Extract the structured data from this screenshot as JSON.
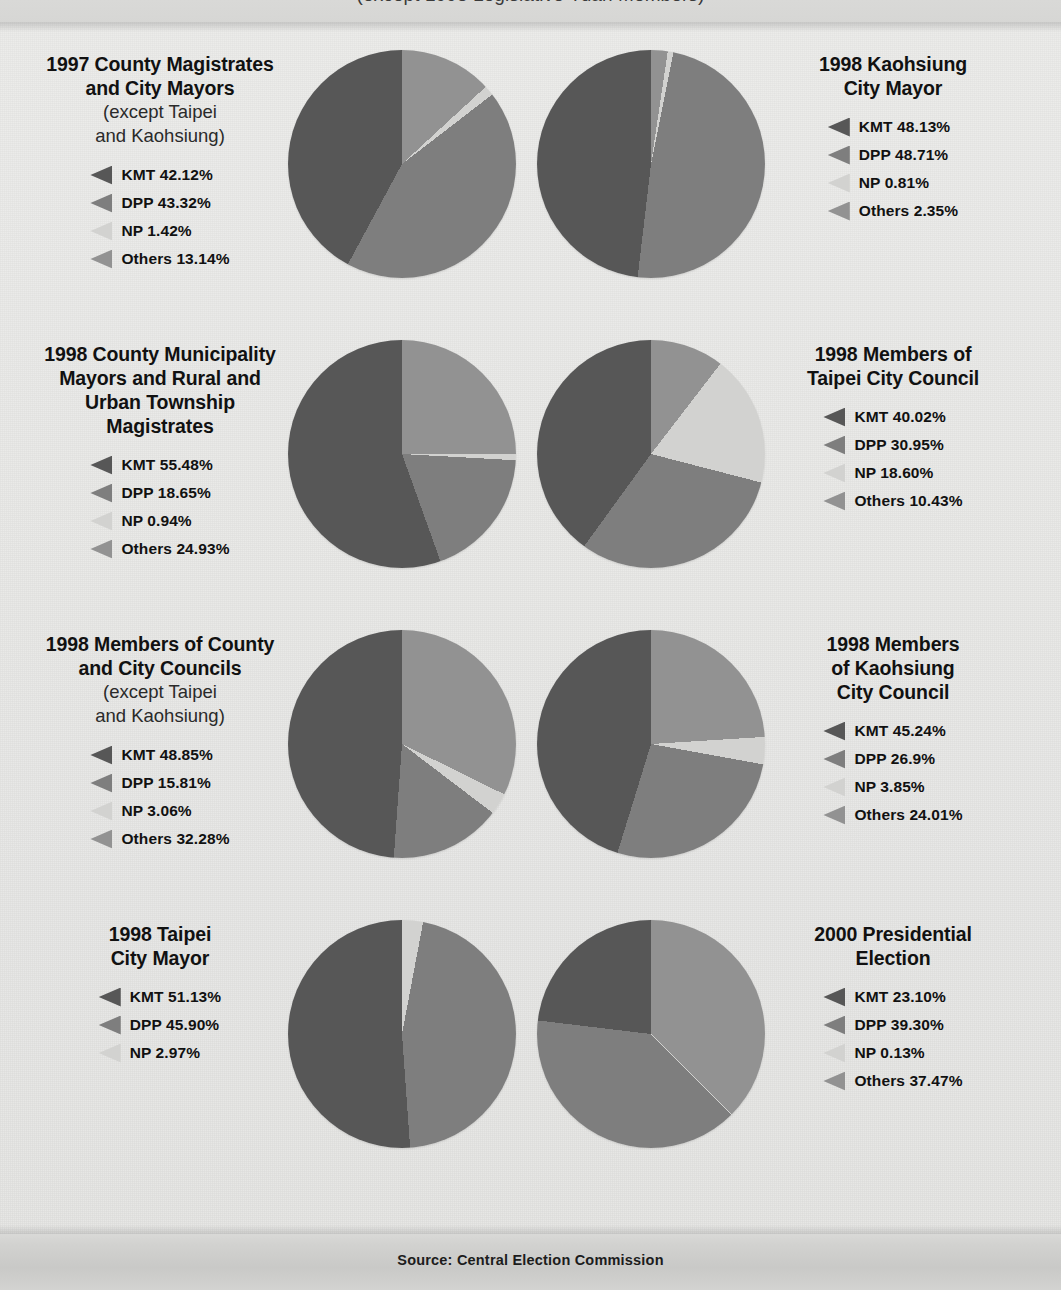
{
  "header": {
    "clipped_note": "(except 1998 Legislative Yuan Members)"
  },
  "footer": {
    "source": "Source: Central Election Commission"
  },
  "colors": {
    "kmt": "#575757",
    "dpp": "#7e7e7e",
    "np": "#d2d2d0",
    "others": "#929292",
    "background": "#e8e8e6",
    "band": "#d4d4d2"
  },
  "chart_data": [
    {
      "type": "pie",
      "title": "1997 County Magistrates",
      "title_line2": "and City Mayors",
      "subtitle": "(except Taipei",
      "subtitle_line2": "and Kaohsiung)",
      "categories": [
        "KMT",
        "DPP",
        "NP",
        "Others"
      ],
      "values": [
        42.12,
        43.32,
        1.42,
        13.14
      ],
      "labels": [
        "KMT 42.12%",
        "DPP 43.32%",
        "NP 1.42%",
        "Others 13.14%"
      ],
      "legend_position": "left",
      "draw_order": [
        "Others",
        "NP",
        "DPP",
        "KMT"
      ],
      "radius": 114
    },
    {
      "type": "pie",
      "title": "1998 Kaohsiung",
      "title_line2": "City Mayor",
      "subtitle": "",
      "subtitle_line2": "",
      "categories": [
        "KMT",
        "DPP",
        "NP",
        "Others"
      ],
      "values": [
        48.13,
        48.71,
        0.81,
        2.35
      ],
      "labels": [
        "KMT 48.13%",
        "DPP 48.71%",
        "NP 0.81%",
        "Others 2.35%"
      ],
      "legend_position": "right",
      "draw_order": [
        "Others",
        "NP",
        "DPP",
        "KMT"
      ],
      "radius": 114
    },
    {
      "type": "pie",
      "title": "1998 County Municipality",
      "title_line2": "Mayors and Rural and",
      "title_line3": "Urban Township",
      "title_line4": "Magistrates",
      "subtitle": "",
      "subtitle_line2": "",
      "categories": [
        "KMT",
        "DPP",
        "NP",
        "Others"
      ],
      "values": [
        55.48,
        18.65,
        0.94,
        24.93
      ],
      "labels": [
        "KMT 55.48%",
        "DPP 18.65%",
        "NP 0.94%",
        "Others 24.93%"
      ],
      "legend_position": "left",
      "draw_order": [
        "Others",
        "NP",
        "DPP",
        "KMT"
      ],
      "radius": 114
    },
    {
      "type": "pie",
      "title": "1998 Members of",
      "title_line2": "Taipei City Council",
      "subtitle": "",
      "subtitle_line2": "",
      "categories": [
        "KMT",
        "DPP",
        "NP",
        "Others"
      ],
      "values": [
        40.02,
        30.95,
        18.6,
        10.43
      ],
      "labels": [
        "KMT 40.02%",
        "DPP 30.95%",
        "NP 18.60%",
        "Others 10.43%"
      ],
      "legend_position": "right",
      "draw_order": [
        "Others",
        "NP",
        "DPP",
        "KMT"
      ],
      "radius": 114
    },
    {
      "type": "pie",
      "title": "1998 Members of County",
      "title_line2": "and City Councils",
      "subtitle": "(except Taipei",
      "subtitle_line2": "and Kaohsiung)",
      "categories": [
        "KMT",
        "DPP",
        "NP",
        "Others"
      ],
      "values": [
        48.85,
        15.81,
        3.06,
        32.28
      ],
      "labels": [
        "KMT 48.85%",
        "DPP 15.81%",
        "NP 3.06%",
        "Others 32.28%"
      ],
      "legend_position": "left",
      "draw_order": [
        "Others",
        "NP",
        "DPP",
        "KMT"
      ],
      "radius": 114
    },
    {
      "type": "pie",
      "title": "1998 Members",
      "title_line2": "of Kaohsiung",
      "title_line3": "City Council",
      "subtitle": "",
      "subtitle_line2": "",
      "categories": [
        "KMT",
        "DPP",
        "NP",
        "Others"
      ],
      "values": [
        45.24,
        26.9,
        3.85,
        24.01
      ],
      "labels": [
        "KMT 45.24%",
        "DPP 26.9%",
        "NP 3.85%",
        "Others 24.01%"
      ],
      "legend_position": "right",
      "draw_order": [
        "Others",
        "NP",
        "DPP",
        "KMT"
      ],
      "radius": 114
    },
    {
      "type": "pie",
      "title": "1998 Taipei",
      "title_line2": "City Mayor",
      "subtitle": "",
      "subtitle_line2": "",
      "categories": [
        "KMT",
        "DPP",
        "NP"
      ],
      "values": [
        51.13,
        45.9,
        2.97
      ],
      "labels": [
        "KMT 51.13%",
        "DPP 45.90%",
        "NP 2.97%"
      ],
      "legend_position": "left",
      "draw_order": [
        "NP",
        "DPP",
        "KMT"
      ],
      "radius": 114
    },
    {
      "type": "pie",
      "title": "2000 Presidential",
      "title_line2": "Election",
      "subtitle": "",
      "subtitle_line2": "",
      "categories": [
        "KMT",
        "DPP",
        "NP",
        "Others"
      ],
      "values": [
        23.1,
        39.3,
        0.13,
        37.47
      ],
      "labels": [
        "KMT 23.10%",
        "DPP 39.30%",
        "NP 0.13%",
        "Others 37.47%"
      ],
      "legend_position": "right",
      "draw_order": [
        "Others",
        "NP",
        "DPP",
        "KMT"
      ],
      "radius": 114
    }
  ]
}
